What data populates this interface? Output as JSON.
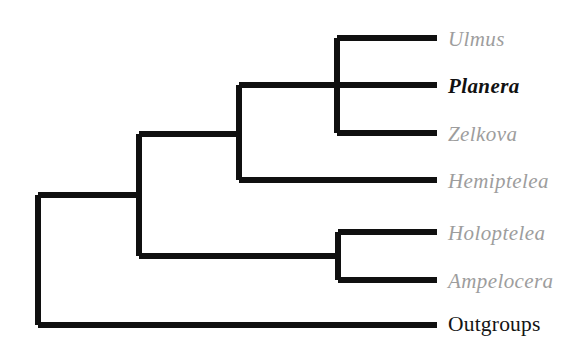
{
  "figure": {
    "type": "cladogram",
    "background_color": "#ffffff",
    "branch_color": "#101010",
    "branch_width_px": 6,
    "genus_label_color": "#9d9d9d",
    "highlight_label_color": "#111111",
    "outgroup_label_color": "#141414"
  },
  "tips": [
    {
      "id": "ulmus",
      "label": "Ulmus",
      "style": "italic-gray",
      "y": 38,
      "label_x": 448,
      "label_y": 29,
      "branch_start_x": 337,
      "branch_end_x": 437
    },
    {
      "id": "planera",
      "label": "Planera",
      "style": "italic-bold-black",
      "y": 85,
      "label_x": 448,
      "label_y": 76,
      "branch_start_x": 239,
      "branch_end_x": 437
    },
    {
      "id": "zelkova",
      "label": "Zelkova",
      "style": "italic-gray",
      "y": 133,
      "label_x": 448,
      "label_y": 124,
      "branch_start_x": 337,
      "branch_end_x": 437
    },
    {
      "id": "hemiptelea",
      "label": "Hemiptelea",
      "style": "italic-gray",
      "y": 180,
      "label_x": 448,
      "label_y": 171,
      "branch_start_x": 239,
      "branch_end_x": 437
    },
    {
      "id": "holoptelea",
      "label": "Holoptelea",
      "style": "italic-gray",
      "y": 232,
      "label_x": 448,
      "label_y": 223,
      "branch_start_x": 338,
      "branch_end_x": 437
    },
    {
      "id": "ampelocera",
      "label": "Ampelocera",
      "style": "italic-gray",
      "y": 280,
      "label_x": 448,
      "label_y": 271,
      "branch_start_x": 338,
      "branch_end_x": 437
    },
    {
      "id": "outgroups",
      "label": "Outgroups",
      "style": "upright-black",
      "y": 325,
      "label_x": 448,
      "label_y": 314,
      "branch_start_x": 38,
      "branch_end_x": 437
    }
  ],
  "nodes": [
    {
      "id": "root",
      "x": 38,
      "y_top": 195,
      "y_bottom": 325,
      "parent_y": null,
      "children": [
        "ingroup",
        "outgroups"
      ]
    },
    {
      "id": "ingroup",
      "x": 139,
      "y_top": 134,
      "y_bottom": 256,
      "parent_x": 38,
      "parent_y": 195,
      "children": [
        "ulmaceae",
        "celtid"
      ]
    },
    {
      "id": "ulmaceae",
      "x": 239,
      "y_top": 85,
      "y_bottom": 180,
      "parent_x": 139,
      "parent_y": 134,
      "children": [
        "upz",
        "hemiptelea"
      ]
    },
    {
      "id": "upz",
      "x": 337,
      "y_top": 38,
      "y_bottom": 133,
      "parent_x": 239,
      "parent_y": 85,
      "children": [
        "ulmus",
        "planera",
        "zelkova"
      ]
    },
    {
      "id": "celtid",
      "x": 338,
      "y_top": 232,
      "y_bottom": 280,
      "parent_x": 139,
      "parent_y": 256,
      "children": [
        "holoptelea",
        "ampelocera"
      ]
    }
  ]
}
